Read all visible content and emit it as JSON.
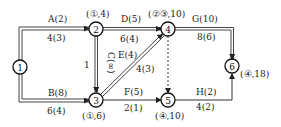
{
  "diagram": {
    "type": "activity-on-arrow network",
    "nodes": [
      {
        "id": "1",
        "label": "1",
        "x": 20,
        "y": 67,
        "mark": ""
      },
      {
        "id": "2",
        "label": "2",
        "x": 96,
        "y": 29,
        "mark": "(①,4)"
      },
      {
        "id": "3",
        "label": "3",
        "x": 96,
        "y": 100,
        "mark": "(①,6)"
      },
      {
        "id": "4",
        "label": "4",
        "x": 168,
        "y": 29,
        "mark": "(②③,10)"
      },
      {
        "id": "5",
        "label": "5",
        "x": 168,
        "y": 100,
        "mark": "(④,10)"
      },
      {
        "id": "6",
        "label": "6",
        "x": 232,
        "y": 66,
        "mark": "(④,18)"
      }
    ],
    "edges": [
      {
        "id": "A",
        "from": "1",
        "to": "2",
        "name": "A(2)",
        "cap": "4(3)",
        "style": "double"
      },
      {
        "id": "B",
        "from": "1",
        "to": "3",
        "name": "B(8)",
        "cap": "6(4)",
        "style": "double"
      },
      {
        "id": "C",
        "from": "2",
        "to": "3",
        "name": "C(∞)",
        "cap": "",
        "style": "double"
      },
      {
        "id": "D",
        "from": "2",
        "to": "4",
        "name": "D(5)",
        "cap": "6(4)",
        "style": "double"
      },
      {
        "id": "E",
        "from": "3",
        "to": "4",
        "name": "E(4)",
        "cap": "4(3)",
        "style": "double"
      },
      {
        "id": "F",
        "from": "3",
        "to": "5",
        "name": "F(5)",
        "cap": "2(1)",
        "style": "single"
      },
      {
        "id": "G",
        "from": "4",
        "to": "6",
        "name": "G(10)",
        "cap": "8(6)",
        "style": "double"
      },
      {
        "id": "H",
        "from": "5",
        "to": "6",
        "name": "H(2)",
        "cap": "4(2)",
        "style": "single"
      },
      {
        "id": "dummy",
        "from": "4",
        "to": "5",
        "name": "",
        "cap": "",
        "style": "dashed"
      }
    ],
    "side_mark_c": "1"
  }
}
